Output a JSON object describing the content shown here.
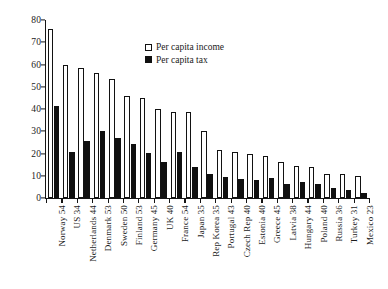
{
  "chart_data": {
    "type": "bar",
    "title": "",
    "xlabel": "",
    "ylabel": "",
    "ylim": [
      0,
      80
    ],
    "ytick_step": 10,
    "yticks": [
      0,
      10,
      20,
      30,
      40,
      50,
      60,
      70,
      80
    ],
    "grid": false,
    "legend_position": "top-center",
    "categories": [
      "Norway 54",
      "US 34",
      "Netherlands 44",
      "Denmark 53",
      "Sweden 50",
      "Finland 53",
      "Germany 45",
      "UK 40",
      "France 54",
      "Japan 35",
      "Rep Korea 35",
      "Portugal 43",
      "Czech Rep 40",
      "Estonia 40",
      "Greece 45",
      "Latvia 38",
      "Hungary 44",
      "Poland 40",
      "Russia 36",
      "Turkey 31",
      "Mexico 23"
    ],
    "series": [
      {
        "name": "Per capita income",
        "color": "#ffffff",
        "edge_color": "#121212",
        "values": [
          76,
          59.7,
          58.3,
          56.3,
          53.7,
          46,
          45,
          40,
          38.7,
          38.7,
          30,
          21.5,
          20.5,
          20,
          19,
          16,
          14.5,
          14,
          11,
          10.7,
          9.7
        ]
      },
      {
        "name": "Per capita tax",
        "color": "#101010",
        "edge_color": "#101010",
        "values": [
          41.3,
          20.6,
          25.6,
          30,
          26.8,
          24.5,
          20.4,
          16,
          20.8,
          13.8,
          10.8,
          9.3,
          8.5,
          8.3,
          8.8,
          6.3,
          7,
          6.2,
          4.3,
          3.5,
          2.3
        ]
      }
    ]
  },
  "legend": {
    "items": [
      {
        "label": "Per capita income",
        "marker": "open-square-icon"
      },
      {
        "label": "Per capita tax",
        "marker": "filled-square-icon"
      }
    ]
  }
}
